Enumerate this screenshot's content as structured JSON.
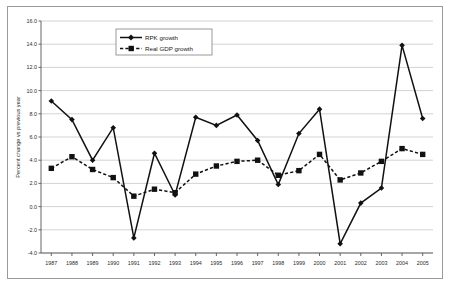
{
  "chart_data": {
    "type": "line",
    "title": "",
    "xlabel": "",
    "ylabel": "Percent change vs previous year",
    "ylim": [
      -4.0,
      16.0
    ],
    "ytick_step": 2.0,
    "grid": true,
    "legend_position": "top-left-inside",
    "categories": [
      "1987",
      "1988",
      "1989",
      "1990",
      "1991",
      "1992",
      "1993",
      "1994",
      "1995",
      "1996",
      "1997",
      "1998",
      "1999",
      "2000",
      "2001",
      "2002",
      "2003",
      "2004",
      "2005"
    ],
    "yticks": [
      "-4.0",
      "-2.0",
      "0.0",
      "2.0",
      "4.0",
      "6.0",
      "8.0",
      "10.0",
      "12.0",
      "14.0",
      "16.0"
    ],
    "series": [
      {
        "name": "RPK growth",
        "marker": "diamond",
        "linestyle": "solid",
        "color": "#111111",
        "values": [
          9.1,
          7.5,
          4.0,
          6.8,
          -2.7,
          4.6,
          1.0,
          7.7,
          7.0,
          7.9,
          5.7,
          1.9,
          6.3,
          8.4,
          -3.2,
          0.3,
          1.6,
          13.9,
          7.6
        ]
      },
      {
        "name": "Real GDP growth",
        "marker": "square",
        "linestyle": "dashed",
        "color": "#111111",
        "values": [
          3.3,
          4.3,
          3.2,
          2.5,
          0.9,
          1.5,
          1.2,
          2.8,
          3.5,
          3.9,
          4.0,
          2.7,
          3.1,
          4.5,
          2.3,
          2.9,
          3.9,
          5.0,
          4.5
        ]
      }
    ]
  },
  "legend": {
    "items": [
      {
        "label": "RPK growth"
      },
      {
        "label": "Real GDP growth"
      }
    ]
  },
  "axes": {
    "y_title": "Percent change vs previous year"
  }
}
